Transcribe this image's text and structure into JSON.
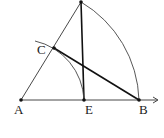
{
  "diagram": {
    "type": "geometry-construction",
    "colors": {
      "stroke": "#1a1a1a",
      "background": "#ffffff"
    },
    "points": {
      "A": {
        "label": "A",
        "x": 21,
        "y": 100
      },
      "E": {
        "label": "E",
        "x": 84,
        "y": 100
      },
      "B": {
        "label": "B",
        "x": 139,
        "y": 100
      },
      "C": {
        "label": "C",
        "x": 54,
        "y": 48
      },
      "top": {
        "label": "",
        "x": 81,
        "y": 2
      }
    },
    "segments": [
      {
        "from": "A",
        "to": "top"
      },
      {
        "from": "top",
        "to": "E"
      },
      {
        "from": "C",
        "to": "B"
      },
      {
        "from": "A",
        "to": "B",
        "ray": true
      }
    ],
    "arcs": [
      {
        "center": "A",
        "from": "top",
        "to": "B",
        "description": "large arc"
      },
      {
        "center": "A",
        "through": "C",
        "to": "E",
        "description": "small arc"
      }
    ]
  }
}
